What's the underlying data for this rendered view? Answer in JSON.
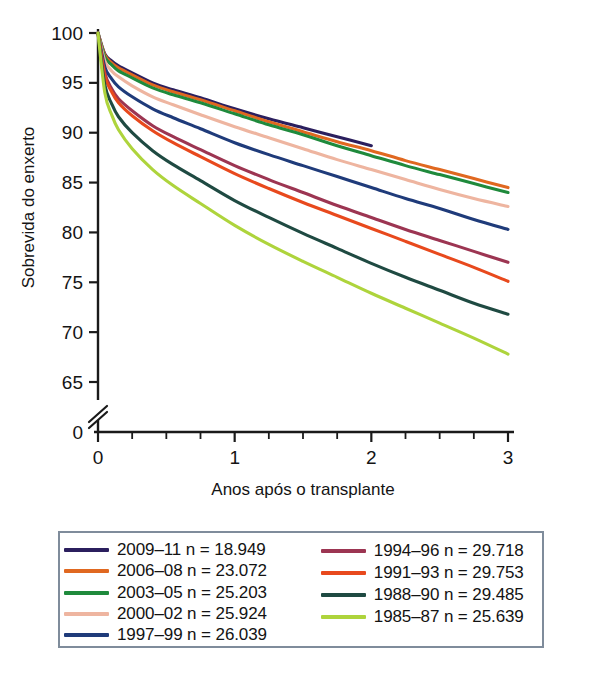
{
  "chart_data": {
    "type": "line",
    "title": "",
    "xlabel": "Anos após o transplante",
    "ylabel": "Sobrevida do enxerto",
    "xlim": [
      0,
      3
    ],
    "ylim": [
      63,
      100
    ],
    "y_axis_break": true,
    "y_break_label": "0",
    "grid": false,
    "legend_position": "bottom",
    "x_ticks": [
      "0",
      "1",
      "2",
      "3"
    ],
    "x_tick_values": [
      0,
      1,
      2,
      3
    ],
    "x_minor_tick_values": [
      0.25,
      0.5,
      0.75,
      1.25,
      1.5,
      1.75,
      2.25,
      2.5,
      2.75
    ],
    "y_ticks": [
      "65",
      "70",
      "75",
      "80",
      "85",
      "90",
      "95",
      "100"
    ],
    "y_tick_values": [
      65,
      70,
      75,
      80,
      85,
      90,
      95,
      100
    ],
    "x": [
      0,
      0.05,
      0.1,
      0.15,
      0.25,
      0.4,
      0.55,
      0.75,
      1.0,
      1.25,
      1.5,
      1.75,
      2.0,
      2.25,
      2.5,
      2.75,
      3.0
    ],
    "series": [
      {
        "name": "2009–11",
        "label": "2009–11 n = 18.949",
        "n": "18.949",
        "color": "#2b1f5e",
        "values": [
          100,
          97.9,
          97.2,
          96.7,
          96.0,
          95.0,
          94.3,
          93.5,
          92.4,
          91.4,
          90.5,
          89.6,
          88.7,
          null,
          null,
          null,
          null
        ]
      },
      {
        "name": "2006–08",
        "label": "2006–08 n = 23.072",
        "n": "23.072",
        "color": "#e06820",
        "values": [
          100,
          97.8,
          97.0,
          96.5,
          95.8,
          94.8,
          94.1,
          93.3,
          92.2,
          91.1,
          90.1,
          89.1,
          88.2,
          87.2,
          86.3,
          85.4,
          84.5
        ]
      },
      {
        "name": "2003–05",
        "label": "2003–05 n = 25.203",
        "n": "25.203",
        "color": "#1f8a3c",
        "values": [
          100,
          97.6,
          96.8,
          96.2,
          95.5,
          94.5,
          93.8,
          93.0,
          91.9,
          90.8,
          89.8,
          88.7,
          87.7,
          86.7,
          85.8,
          84.9,
          84.0
        ]
      },
      {
        "name": "2000–02",
        "label": "2000–02 n = 25.924",
        "n": "25.924",
        "color": "#eeb5a0",
        "values": [
          100,
          97.2,
          96.2,
          95.6,
          94.7,
          93.6,
          92.8,
          91.8,
          90.6,
          89.5,
          88.4,
          87.3,
          86.3,
          85.3,
          84.3,
          83.4,
          82.6
        ]
      },
      {
        "name": "1997–99",
        "label": "1997–99 n = 26.039",
        "n": "26.039",
        "color": "#1f3b7a",
        "values": [
          100,
          96.6,
          95.4,
          94.6,
          93.6,
          92.4,
          91.5,
          90.4,
          89.0,
          87.8,
          86.7,
          85.6,
          84.5,
          83.4,
          82.4,
          81.3,
          80.3
        ]
      },
      {
        "name": "1994–96",
        "label": "1994–96 n = 29.718",
        "n": "29.718",
        "color": "#9c3552",
        "values": [
          100,
          96.0,
          94.4,
          93.4,
          92.2,
          90.7,
          89.6,
          88.3,
          86.7,
          85.3,
          84.0,
          82.7,
          81.5,
          80.3,
          79.2,
          78.1,
          77.0
        ]
      },
      {
        "name": "1991–93",
        "label": "1991–93 n = 29.753",
        "n": "29.753",
        "color": "#e8491d",
        "values": [
          100,
          95.7,
          94.1,
          93.0,
          91.7,
          90.2,
          89.0,
          87.6,
          85.9,
          84.4,
          83.0,
          81.7,
          80.4,
          79.1,
          77.8,
          76.5,
          75.1
        ]
      },
      {
        "name": "1988–90",
        "label": "1988–90 n = 29.485",
        "n": "29.485",
        "color": "#1f4a42",
        "values": [
          100,
          94.8,
          92.9,
          91.6,
          90.0,
          88.2,
          86.8,
          85.2,
          83.2,
          81.5,
          79.9,
          78.4,
          76.9,
          75.5,
          74.2,
          72.9,
          71.8
        ]
      },
      {
        "name": "1985–87",
        "label": "1985–87 n = 25.639",
        "n": "25.639",
        "color": "#aed43c",
        "values": [
          100,
          94.0,
          91.8,
          90.3,
          88.4,
          86.3,
          84.7,
          82.9,
          80.7,
          78.8,
          77.1,
          75.5,
          73.9,
          72.4,
          70.9,
          69.4,
          67.8
        ]
      }
    ]
  },
  "legend": {
    "left_column": [
      "2009–11 n = 18.949",
      "2006–08 n = 23.072",
      "2003–05 n = 25.203",
      "2000–02 n = 25.924",
      "1997–99 n = 26.039"
    ],
    "right_column": [
      "1994–96 n = 29.718",
      "1991–93 n = 29.753",
      "1988–90 n = 29.485",
      "1985–87 n = 25.639"
    ],
    "border_color": "#7f8c9b"
  }
}
